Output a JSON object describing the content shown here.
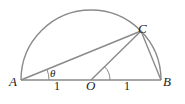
{
  "diagram": {
    "title": "",
    "points": {
      "A": {
        "label": "A"
      },
      "B": {
        "label": "B"
      },
      "C": {
        "label": "C"
      },
      "O": {
        "label": "O"
      }
    },
    "angle_label": "θ",
    "segment_labels": {
      "AO": "1",
      "OB": "1"
    },
    "colors": {
      "stroke": "#8a8a8a",
      "text": "#222222"
    }
  }
}
